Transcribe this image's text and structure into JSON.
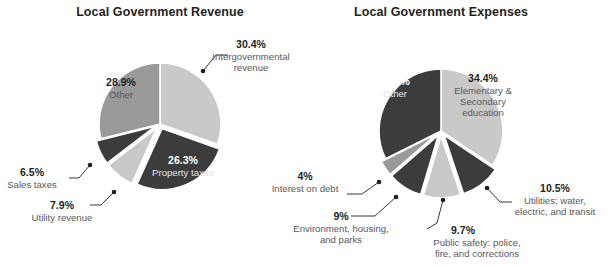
{
  "figure": {
    "background": "#ffffff",
    "palette": {
      "light_gray": "#c9c9c9",
      "medium_gray": "#9a9a9a",
      "dark_gray": "#3c3c3c",
      "slice_border": "#ffffff",
      "text_dark": "#231f20",
      "text_muted": "#58595b",
      "text_on_dark": "#e6e6e6"
    }
  },
  "chart_data": [
    {
      "type": "pie",
      "title": "Local Government Revenue",
      "xlabel": "",
      "ylabel": "",
      "legend": "none",
      "grid": false,
      "center": [
        160,
        124
      ],
      "radius": 61,
      "start_angle_deg": 0,
      "categories": [
        "Intergovernmental revenue",
        "Property taxes",
        "Utility revenue",
        "Sales taxes",
        "Other"
      ],
      "values": [
        30.4,
        26.3,
        7.9,
        6.5,
        28.9
      ],
      "slices": [
        {
          "name": "Intergovernmental revenue",
          "value": 30.4,
          "value_label": "30.4%",
          "label": "Intergovernmental\nrevenue",
          "label_lines": [
            "Intergovernmental",
            "revenue"
          ],
          "color": "#c9c9c9",
          "label_placement": "outside-right",
          "exploded": false
        },
        {
          "name": "Property taxes",
          "value": 26.3,
          "value_label": "26.3%",
          "label": "Property taxes",
          "label_lines": [
            "Property taxes"
          ],
          "color": "#3c3c3c",
          "label_placement": "inside",
          "exploded": true
        },
        {
          "name": "Utility revenue",
          "value": 7.9,
          "value_label": "7.9%",
          "label": "Utility revenue",
          "label_lines": [
            "Utility revenue"
          ],
          "color": "#c9c9c9",
          "label_placement": "outside-left",
          "exploded": true
        },
        {
          "name": "Sales taxes",
          "value": 6.5,
          "value_label": "6.5%",
          "label": "Sales taxes",
          "label_lines": [
            "Sales taxes"
          ],
          "color": "#3c3c3c",
          "label_placement": "outside-left",
          "exploded": true
        },
        {
          "name": "Other",
          "value": 28.9,
          "value_label": "28.9%",
          "label": "Other",
          "label_lines": [
            "Other"
          ],
          "color": "#9a9a9a",
          "label_placement": "inside",
          "exploded": false
        }
      ]
    },
    {
      "type": "pie",
      "title": "Local Government Expenses",
      "xlabel": "",
      "ylabel": "",
      "legend": "none",
      "grid": false,
      "center": [
        441,
        131
      ],
      "radius": 62,
      "start_angle_deg": 0,
      "categories": [
        "Elementary & Secondary education",
        "Utilities: water, electric, and transit",
        "Public safety: police, fire, and corrections",
        "Environment, housing, and parks",
        "Interest on debt",
        "Other"
      ],
      "values": [
        34.4,
        10.5,
        9.7,
        9.0,
        4.0,
        32.4
      ],
      "slices": [
        {
          "name": "Elementary & Secondary education",
          "value": 34.4,
          "value_label": "34.4%",
          "label": "Elementary &\nSecondary\neducation",
          "label_lines": [
            "Elementary &",
            "Secondary",
            "education"
          ],
          "color": "#c9c9c9",
          "label_placement": "inside",
          "exploded": false
        },
        {
          "name": "Utilities: water, electric, and transit",
          "value": 10.5,
          "value_label": "10.5%",
          "label": "Utilities: water,\nelectric, and transit",
          "label_lines": [
            "Utilities: water,",
            "electric, and transit"
          ],
          "color": "#3c3c3c",
          "label_placement": "outside-right",
          "exploded": true
        },
        {
          "name": "Public safety: police, fire, and corrections",
          "value": 9.7,
          "value_label": "9.7%",
          "label": "Public safety: police,\nfire, and corrections",
          "label_lines": [
            "Public safety: police,",
            "fire, and corrections"
          ],
          "color": "#c9c9c9",
          "label_placement": "outside-bottom",
          "exploded": true
        },
        {
          "name": "Environment, housing, and parks",
          "value": 9.0,
          "value_label": "9%",
          "label": "Environment, housing,\nand parks",
          "label_lines": [
            "Environment, housing,",
            "and parks"
          ],
          "color": "#3c3c3c",
          "label_placement": "outside-left",
          "exploded": true
        },
        {
          "name": "Interest on debt",
          "value": 4.0,
          "value_label": "4%",
          "label": "Interest on debt",
          "label_lines": [
            "Interest on debt"
          ],
          "color": "#9a9a9a",
          "label_placement": "outside-left",
          "exploded": true
        },
        {
          "name": "Other",
          "value": 32.4,
          "value_label": "32.4%",
          "label": "Other",
          "label_lines": [
            "Other"
          ],
          "color": "#3c3c3c",
          "label_placement": "inside",
          "exploded": false
        }
      ]
    }
  ]
}
